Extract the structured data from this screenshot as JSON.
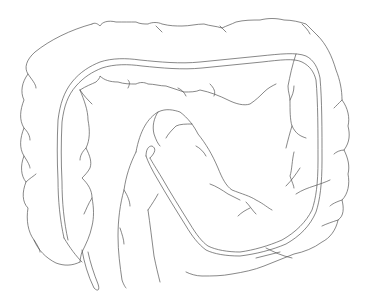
{
  "illustration": {
    "subject": "colon line drawing",
    "style": "black line art on white background",
    "colors": {
      "background": "#ffffff",
      "stroke": "#555555"
    },
    "parts": [
      {
        "id": "ascending-colon",
        "label": "ascending colon"
      },
      {
        "id": "transverse-colon",
        "label": "transverse colon"
      },
      {
        "id": "descending-colon",
        "label": "descending colon"
      },
      {
        "id": "sigmoid-colon",
        "label": "sigmoid colon"
      },
      {
        "id": "inner-tube",
        "label": "inner double-line tube"
      }
    ]
  }
}
